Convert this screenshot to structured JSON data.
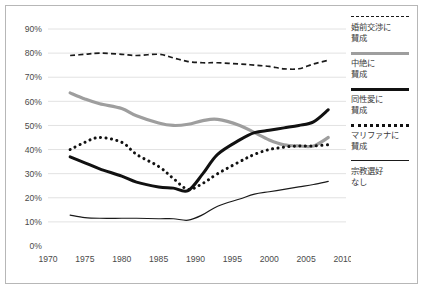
{
  "chart_data": {
    "type": "line",
    "title": "",
    "subtitle": "",
    "xlabel": "",
    "ylabel": "",
    "xlim": [
      1970,
      2010
    ],
    "ylim": [
      0,
      90
    ],
    "grid": true,
    "legend_position": "right",
    "x_ticks": [
      "1970",
      "1975",
      "1980",
      "1985",
      "1990",
      "1995",
      "2000",
      "2005",
      "2010"
    ],
    "y_ticks": [
      "0%",
      "10%",
      "20%",
      "30%",
      "40%",
      "50%",
      "60%",
      "70%",
      "80%",
      "90%"
    ],
    "series": [
      {
        "name": "婚前交渉に\n賛成",
        "style": "dashed",
        "color": "#1a1a1a",
        "x": [
          1973,
          1975,
          1977,
          1980,
          1982,
          1985,
          1987,
          1989,
          1991,
          1993,
          1996,
          1998,
          2000,
          2002,
          2004,
          2006,
          2008
        ],
        "values": [
          79.0,
          79.5,
          80.0,
          79.5,
          79.0,
          79.5,
          78.0,
          76.5,
          76.0,
          76.0,
          75.5,
          75.0,
          74.5,
          73.5,
          73.5,
          75.5,
          77.0
        ]
      },
      {
        "name": "中絶に\n賛成",
        "style": "gray-thick",
        "color": "#9e9e9e",
        "x": [
          1973,
          1975,
          1977,
          1980,
          1982,
          1985,
          1987,
          1989,
          1991,
          1993,
          1996,
          1998,
          2000,
          2002,
          2004,
          2006,
          2008
        ],
        "values": [
          63.5,
          61.0,
          59.0,
          57.0,
          54.0,
          51.0,
          50.0,
          50.5,
          52.0,
          52.5,
          50.0,
          47.0,
          44.0,
          42.0,
          41.5,
          41.5,
          45.0
        ]
      },
      {
        "name": "同性愛に\n賛成",
        "style": "black-thick",
        "color": "#111111",
        "x": [
          1973,
          1975,
          1977,
          1980,
          1982,
          1985,
          1987,
          1989,
          1991,
          1993,
          1996,
          1998,
          2000,
          2002,
          2004,
          2006,
          2008
        ],
        "values": [
          37.0,
          34.5,
          32.0,
          29.0,
          26.5,
          24.5,
          24.0,
          23.0,
          30.0,
          38.0,
          44.0,
          47.0,
          48.0,
          49.0,
          50.0,
          51.5,
          56.5
        ]
      },
      {
        "name": "マリファナに\n賛成",
        "style": "dotted",
        "color": "#111111",
        "x": [
          1973,
          1975,
          1977,
          1980,
          1982,
          1985,
          1987,
          1989,
          1991,
          1993,
          1996,
          1998,
          2000,
          2002,
          2004,
          2006,
          2008
        ],
        "values": [
          40.0,
          43.0,
          45.0,
          43.0,
          38.0,
          33.0,
          28.0,
          23.5,
          26.0,
          30.0,
          35.0,
          38.0,
          40.0,
          41.0,
          41.5,
          41.5,
          42.0
        ]
      },
      {
        "name": "宗教選好\nなし",
        "style": "thin",
        "color": "#1a1a1a",
        "x": [
          1973,
          1975,
          1977,
          1980,
          1982,
          1985,
          1987,
          1989,
          1991,
          1993,
          1996,
          1998,
          2000,
          2002,
          2004,
          2006,
          2008
        ],
        "values": [
          12.8,
          11.8,
          11.5,
          11.5,
          11.5,
          11.3,
          11.3,
          10.7,
          13.0,
          16.5,
          19.5,
          21.5,
          22.5,
          23.5,
          24.5,
          25.5,
          26.8
        ]
      }
    ]
  },
  "legend": {
    "items": [
      {
        "label": "婚前交渉に\n賛成",
        "swatch": "dashed-line-swatch"
      },
      {
        "label": "中絶に\n賛成",
        "swatch": "gray-line-swatch"
      },
      {
        "label": "同性愛に\n賛成",
        "swatch": "black-thick-line-swatch"
      },
      {
        "label": "マリファナに\n賛成",
        "swatch": "dotted-line-swatch"
      },
      {
        "label": "宗教選好\nなし",
        "swatch": "thin-line-swatch"
      }
    ]
  }
}
